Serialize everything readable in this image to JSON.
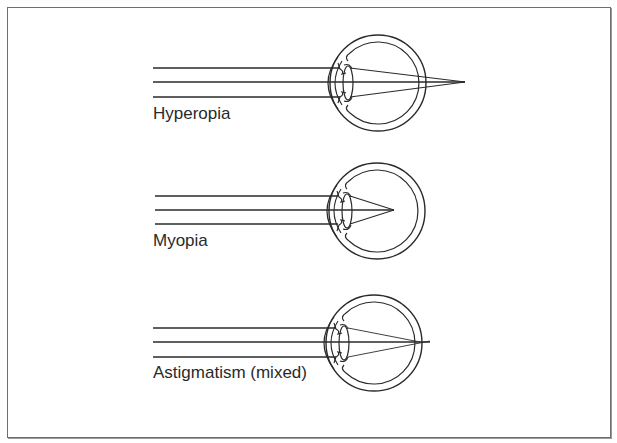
{
  "diagram": {
    "panels": [
      {
        "id": "hyperopia",
        "label": "Hyperopia",
        "focus": "behind retina"
      },
      {
        "id": "myopia",
        "label": "Myopia",
        "focus": "in front of retina"
      },
      {
        "id": "astigmatism",
        "label": "Astigmatism (mixed)",
        "focus": "multiple focal points"
      }
    ],
    "colors": {
      "line": "#2a2a2a",
      "border": "#6e6e6e",
      "background": "#ffffff"
    }
  }
}
